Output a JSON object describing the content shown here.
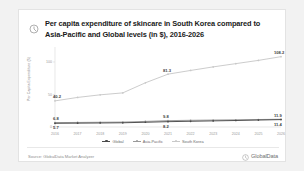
{
  "card": {
    "title": "Per capita expenditure of skincare in South Korea compared to Asia-Pacific  and Global levels (in $), 2016-2026",
    "title_icon": "clock-icon"
  },
  "footer": {
    "source": "Source: GlobalData Market Analyzer",
    "brand": "GlobalData",
    "brand_icon": "globaldata-logo-icon"
  },
  "legend": {
    "position": "bottom-center",
    "items": [
      {
        "label": "Global",
        "color": "#4a4a4a",
        "icon": "line-marker-icon"
      },
      {
        "label": "Asia-Pacific",
        "color": "#9a9a9a",
        "icon": "line-marker-icon"
      },
      {
        "label": "South Korea",
        "color": "#c9c9c9",
        "icon": "line-marker-icon"
      }
    ]
  },
  "colors": {
    "global": "#4a4a4a",
    "asia_pacific": "#9a9a9a",
    "south_korea": "#c9c9c9",
    "card_bg": "#ffffff",
    "page_bg": "#f2f2f2",
    "border": "#e3e3e3",
    "label_text": "#3d3d3d",
    "axis_text": "#9a9a9a"
  },
  "chart_data": {
    "type": "line",
    "title": "Per capita expenditure of skincare in South Korea compared to Asia-Pacific  and Global levels (in $), 2016-2026",
    "xlabel": "",
    "ylabel": "Per Capita Expenditure ($)",
    "categories": [
      "2016",
      "2017",
      "2018",
      "2019",
      "2020",
      "2021",
      "2022",
      "2023",
      "2024",
      "2025",
      "2026"
    ],
    "ylim": [
      0,
      120
    ],
    "yticks": [
      0,
      50,
      100
    ],
    "ytick_labels": [
      "0",
      "50",
      "100"
    ],
    "grid": false,
    "series": [
      {
        "name": "South Korea",
        "color": "#c9c9c9",
        "values": [
          40.2,
          45.5,
          49.5,
          52.5,
          68.0,
          81.3,
          87.0,
          92.5,
          97.5,
          102.5,
          108.2
        ]
      },
      {
        "name": "Asia-Pacific",
        "color": "#9a9a9a",
        "values": [
          6.8,
          7.0,
          7.3,
          7.6,
          8.6,
          9.8,
          10.3,
          10.7,
          11.1,
          11.5,
          11.9
        ]
      },
      {
        "name": "Global",
        "color": "#4a4a4a",
        "values": [
          5.7,
          5.9,
          6.2,
          6.5,
          7.3,
          8.2,
          8.8,
          9.4,
          10.0,
          10.7,
          11.4
        ]
      }
    ],
    "data_labels": [
      {
        "series": "South Korea",
        "category": "2016",
        "value": "40.2"
      },
      {
        "series": "South Korea",
        "category": "2021",
        "value": "81.3"
      },
      {
        "series": "South Korea",
        "category": "2026",
        "value": "108.2"
      },
      {
        "series": "Asia-Pacific",
        "category": "2016",
        "value": "6.8"
      },
      {
        "series": "Asia-Pacific",
        "category": "2021",
        "value": "9.8"
      },
      {
        "series": "Asia-Pacific",
        "category": "2026",
        "value": "11.9"
      },
      {
        "series": "Global",
        "category": "2016",
        "value": "5.7"
      },
      {
        "series": "Global",
        "category": "2021",
        "value": "8.2"
      },
      {
        "series": "Global",
        "category": "2026",
        "value": "11.4"
      }
    ]
  }
}
